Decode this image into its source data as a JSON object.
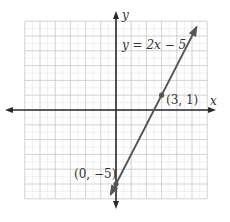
{
  "chart_data": {
    "type": "line",
    "title": "",
    "equation_label": "y = 2x − 5",
    "xlabel": "x",
    "ylabel": "y",
    "xlim": [
      -6,
      6
    ],
    "ylim": [
      -6,
      6
    ],
    "grid": true,
    "minor_grid": true,
    "series": [
      {
        "name": "y = 2x − 5",
        "slope": 2,
        "intercept": -5,
        "x": [
          -0.35,
          5.3
        ],
        "y": [
          -5.7,
          5.6
        ]
      }
    ],
    "points": [
      {
        "x": 0,
        "y": -5,
        "label": "(0, −5)"
      },
      {
        "x": 3,
        "y": 1,
        "label": "(3, 1)"
      }
    ]
  },
  "labels": {
    "x_axis": "x",
    "y_axis": "y",
    "equation": "y = 2x − 5",
    "point_a": "(3, 1)",
    "point_b": "(0, −5)"
  },
  "colors": {
    "axis": "#2a2a2a",
    "line": "#555555",
    "grid": "#c8c8c8",
    "text": "#333333"
  }
}
